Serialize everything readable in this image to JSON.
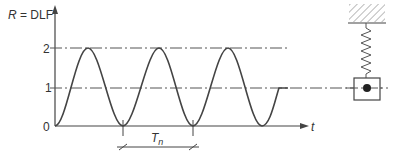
{
  "diagram": {
    "y_axis_label": "R = DLF",
    "y_axis_label_italic": "R",
    "y_axis_label_rest": " = DLF",
    "x_axis_label": "t",
    "y_ticks": [
      {
        "label": "2",
        "value": 2
      },
      {
        "label": "1",
        "value": 1
      },
      {
        "label": "0",
        "value": 0
      }
    ],
    "period_label": "T",
    "period_subscript": "n",
    "curve": "R(t) = 1 - cos(2πt/Tn), about 2.5 cycles, then constant at 1",
    "reference_lines": [
      "R = 2 (dash-dot)",
      "R = 1 (dash-dot, extends to mass)"
    ],
    "model": "mass suspended by spring from fixed support",
    "colors": {
      "line": "#444444",
      "text": "#333333"
    }
  }
}
